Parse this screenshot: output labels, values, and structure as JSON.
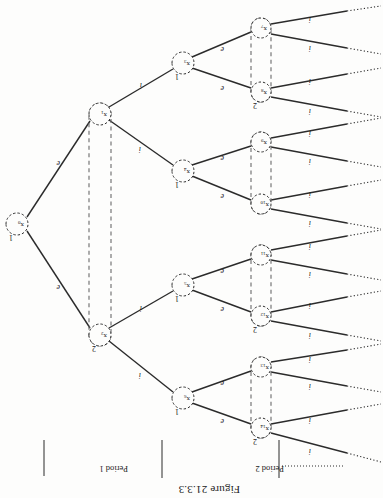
{
  "figure": {
    "title": "Figure 21.3.3",
    "orientation_deg": 180,
    "type": "extensive-form-game-tree"
  },
  "periods": [
    {
      "id": "period-1",
      "label": "Period 1"
    },
    {
      "id": "period-2",
      "label": "Period 2"
    }
  ],
  "nodes": [
    {
      "id": "x0",
      "label": "x",
      "sub": "0",
      "player": "1",
      "cx": 366,
      "cy": 274,
      "r": 11
    },
    {
      "id": "x1",
      "label": "x",
      "sub": "1",
      "player": "",
      "cx": 283,
      "cy": 384,
      "r": 11
    },
    {
      "id": "x2",
      "label": "x",
      "sub": "2",
      "player": "2",
      "cx": 283,
      "cy": 163,
      "r": 11
    },
    {
      "id": "x3",
      "label": "x",
      "sub": "3",
      "player": "1",
      "cx": 200,
      "cy": 435,
      "r": 11
    },
    {
      "id": "x4",
      "label": "x",
      "sub": "4",
      "player": "1",
      "cx": 200,
      "cy": 327,
      "r": 11
    },
    {
      "id": "x5",
      "label": "x",
      "sub": "5",
      "player": "1",
      "cx": 200,
      "cy": 213,
      "r": 11
    },
    {
      "id": "x6",
      "label": "x",
      "sub": "6",
      "player": "1",
      "cx": 200,
      "cy": 100,
      "r": 11
    },
    {
      "id": "x7",
      "label": "x",
      "sub": "7",
      "player": "",
      "cx": 122,
      "cy": 470,
      "r": 10
    },
    {
      "id": "x8",
      "label": "x",
      "sub": "8",
      "player": "2",
      "cx": 122,
      "cy": 406,
      "r": 10
    },
    {
      "id": "x9",
      "label": "x",
      "sub": "9",
      "player": "",
      "cx": 122,
      "cy": 356,
      "r": 10
    },
    {
      "id": "x10",
      "label": "x",
      "sub": "10",
      "player": "",
      "cx": 122,
      "cy": 294,
      "r": 10
    },
    {
      "id": "x11",
      "label": "x",
      "sub": "11",
      "player": "",
      "cx": 122,
      "cy": 243,
      "r": 10
    },
    {
      "id": "x12",
      "label": "x",
      "sub": "12",
      "player": "2",
      "cx": 122,
      "cy": 182,
      "r": 10
    },
    {
      "id": "x13",
      "label": "x",
      "sub": "13",
      "player": "",
      "cx": 122,
      "cy": 131,
      "r": 10
    },
    {
      "id": "x14",
      "label": "x",
      "sub": "14",
      "player": "2",
      "cx": 122,
      "cy": 70,
      "r": 10
    }
  ],
  "edges": [
    {
      "from": "x0",
      "to": "x2",
      "label": "e"
    },
    {
      "from": "x0",
      "to": "x1",
      "label": "e"
    },
    {
      "from": "x2",
      "to": "x6",
      "label": "i"
    },
    {
      "from": "x2",
      "to": "x5",
      "label": "i"
    },
    {
      "from": "x1",
      "to": "x4",
      "label": "i"
    },
    {
      "from": "x1",
      "to": "x3",
      "label": "i"
    },
    {
      "from": "x6",
      "to": "x14",
      "label": "e"
    },
    {
      "from": "x6",
      "to": "x13",
      "label": "e"
    },
    {
      "from": "x5",
      "to": "x12",
      "label": "e"
    },
    {
      "from": "x5",
      "to": "x11",
      "label": "e"
    },
    {
      "from": "x4",
      "to": "x10",
      "label": "e"
    },
    {
      "from": "x4",
      "to": "x9",
      "label": "e"
    },
    {
      "from": "x3",
      "to": "x8",
      "label": "e"
    },
    {
      "from": "x3",
      "to": "x7",
      "label": "e"
    }
  ],
  "terminal_edges": [
    {
      "from": "x14",
      "label": "i"
    },
    {
      "from": "x14",
      "label": "i"
    },
    {
      "from": "x13",
      "label": "i"
    },
    {
      "from": "x13",
      "label": "i"
    },
    {
      "from": "x12",
      "label": "i"
    },
    {
      "from": "x12",
      "label": "i"
    },
    {
      "from": "x11",
      "label": "i"
    },
    {
      "from": "x11",
      "label": "i"
    },
    {
      "from": "x10",
      "label": "i"
    },
    {
      "from": "x10",
      "label": "i"
    },
    {
      "from": "x9",
      "label": "i"
    },
    {
      "from": "x9",
      "label": "i"
    },
    {
      "from": "x8",
      "label": "i"
    },
    {
      "from": "x8",
      "label": "i"
    },
    {
      "from": "x7",
      "label": "i"
    },
    {
      "from": "x7",
      "label": "i"
    }
  ],
  "information_sets": [
    {
      "id": "infoset-x1-x2",
      "nodes": [
        "x1",
        "x2"
      ],
      "player": "2"
    },
    {
      "id": "infoset-x13-x14",
      "nodes": [
        "x13",
        "x14"
      ],
      "player": "2"
    },
    {
      "id": "infoset-x11-x12",
      "nodes": [
        "x11",
        "x12"
      ],
      "player": "2"
    },
    {
      "id": "infoset-x9-x10",
      "nodes": [
        "x9",
        "x10"
      ],
      "player": "2"
    },
    {
      "id": "infoset-x7-x8",
      "nodes": [
        "x7",
        "x8"
      ],
      "player": "2"
    }
  ],
  "colors": {
    "ink": "#1a1a1a",
    "line": "#2b2b2b",
    "dashed": "#6a6a6a",
    "paper": "#fdfdfc"
  }
}
